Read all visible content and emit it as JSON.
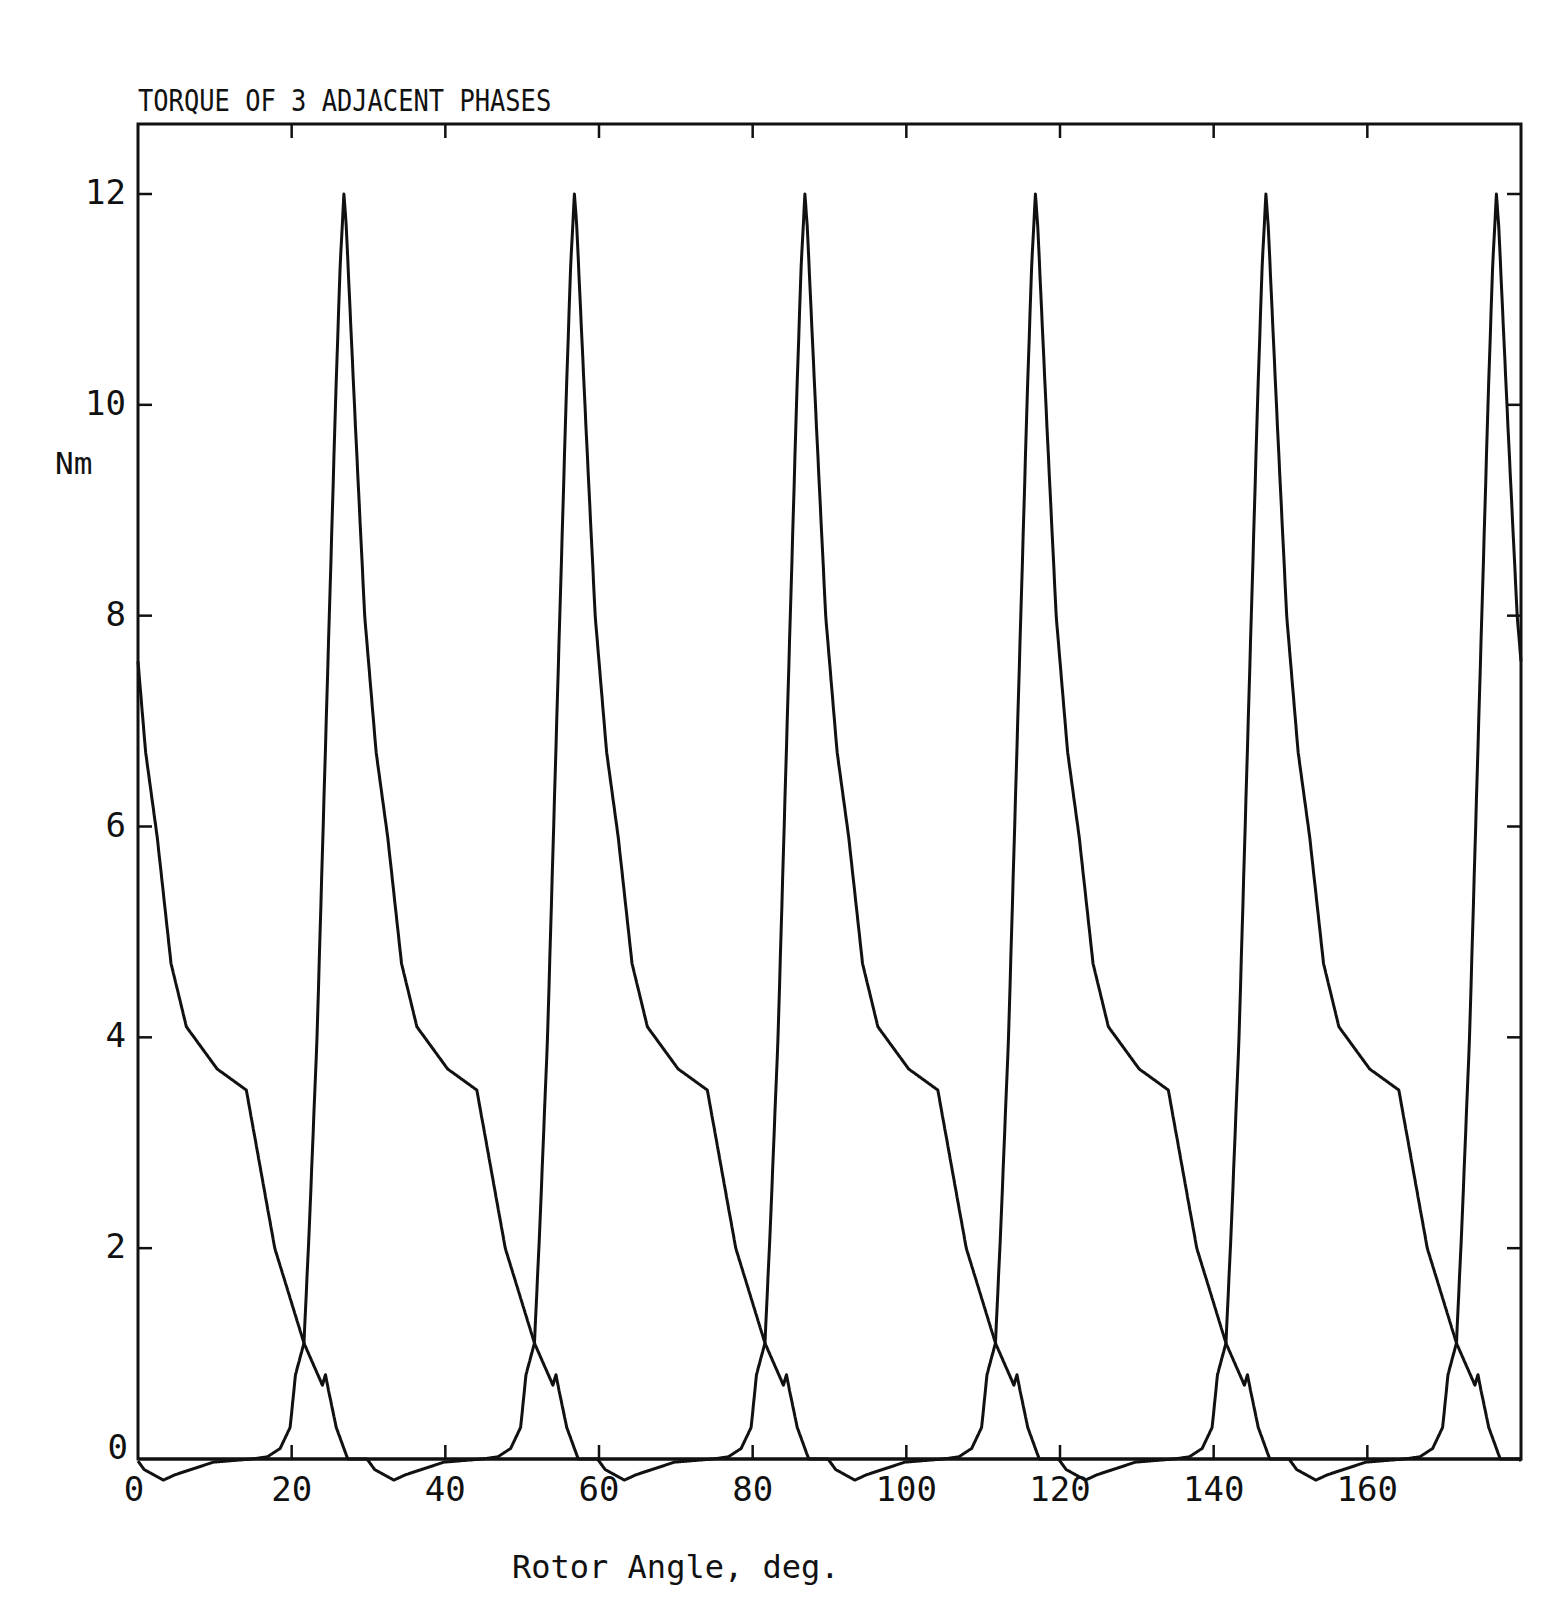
{
  "chart_data": {
    "type": "line",
    "title": "TORQUE OF 3 ADJACENT PHASES",
    "xlabel": "Rotor Angle, deg.",
    "ylabel": "Nm",
    "xlim": [
      0,
      180
    ],
    "ylim": [
      0,
      12.6
    ],
    "xticks": [
      0,
      20,
      40,
      60,
      80,
      100,
      120,
      140,
      160
    ],
    "xtick_labels": [
      "0",
      "20",
      "40",
      "60",
      "80",
      "100",
      "120",
      "140",
      "160"
    ],
    "yticks": [
      0,
      2,
      4,
      6,
      8,
      10,
      12
    ],
    "ytick_labels": [
      "0",
      "2",
      "4",
      "6",
      "8",
      "10",
      "12"
    ],
    "grid": false,
    "legend": null,
    "line_color": "#111111",
    "waveform_period_deg": 90,
    "waveform_template": {
      "description": "Torque of one phase vs angle offset from its peak (deg)",
      "d": [
        -12,
        -10,
        -8.3,
        -7,
        -6.3,
        -5.2,
        -4.5,
        -3.5,
        -2.7,
        -1.9,
        -1.1,
        -0.5,
        0,
        0.3,
        0.8,
        1.5,
        2.7,
        4.2,
        5.7,
        7.5,
        9.5,
        13.5,
        17.3,
        21,
        24.8,
        27.2,
        27.6,
        28.0,
        29,
        30.5,
        33,
        34,
        36.5,
        38,
        43,
        48,
        78
      ],
      "torque": [
        0,
        0.02,
        0.1,
        0.3,
        0.8,
        1.1,
        2.2,
        4,
        6,
        8,
        10,
        11.3,
        12,
        11.7,
        10.9,
        9.8,
        8,
        6.7,
        5.9,
        4.7,
        4.1,
        3.7,
        3.5,
        2.0,
        1.1,
        0.7,
        0.8,
        0.65,
        0.3,
        0,
        0,
        -0.1,
        -0.2,
        -0.15,
        -0.03,
        0,
        0
      ]
    },
    "series": [
      {
        "name": "Phase A",
        "peak_angles": [
          -3.2,
          86.8,
          176.8
        ]
      },
      {
        "name": "Phase B",
        "peak_angles": [
          26.8,
          116.8
        ]
      },
      {
        "name": "Phase C",
        "peak_angles": [
          56.8,
          146.8
        ]
      }
    ],
    "peak_torque_nm": 12,
    "crossover_torque_nm": 1.1
  }
}
